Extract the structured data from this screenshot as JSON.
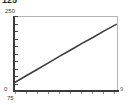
{
  "figure": {
    "top_label": "125",
    "width": 130,
    "height": 105
  },
  "axes": {
    "y_max_label": "250",
    "y_min_label": "0",
    "x_min_label": "75",
    "x_max_label": "9",
    "frame_color": "#b4b4b4",
    "spine_color": "#3a3a3a",
    "tick_color": "#4a4a4a"
  },
  "chart_data": {
    "type": "line",
    "title": "125",
    "xlabel": "",
    "ylabel": "",
    "xlim": [
      75,
      9
    ],
    "ylim": [
      0,
      250
    ],
    "grid": false,
    "legend": null,
    "line_color": "#3c3c3c",
    "x": [
      0,
      1,
      2,
      3,
      4,
      5,
      6,
      7,
      8,
      9
    ],
    "values": [
      30,
      52,
      73,
      95,
      117,
      138,
      160,
      180,
      202,
      222
    ],
    "y_ticks": [
      0,
      25,
      50,
      75,
      100,
      125,
      150,
      175,
      200,
      225,
      250
    ],
    "y_tick_labels": [
      "0",
      "",
      "",
      "",
      "",
      "",
      "",
      "",
      "",
      "",
      "250"
    ],
    "x_ticks": [
      0,
      1,
      2,
      3,
      4,
      5,
      6,
      7,
      8,
      9
    ],
    "x_tick_labels": [
      "",
      "",
      "",
      "",
      "",
      "",
      "",
      "",
      "",
      ""
    ]
  }
}
